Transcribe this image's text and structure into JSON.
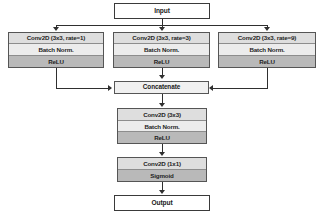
{
  "diagram": {
    "colors": {
      "background": "#ffffff",
      "line": "#2f2f2f",
      "border": "#555555",
      "header_fill": "#dedede",
      "norm_fill": "#ececec",
      "activation_fill": "#b9b9b9",
      "io_fill": "#ffffff",
      "concat_fill": "#f0f0f0"
    },
    "input": {
      "label": "Input"
    },
    "branches": [
      {
        "id": "branch-left",
        "rows": [
          {
            "label": "Conv2D (3x3, rate=1)",
            "style": "header"
          },
          {
            "label": "Batch Norm.",
            "style": "norm"
          },
          {
            "label": "ReLU",
            "style": "act"
          }
        ]
      },
      {
        "id": "branch-middle",
        "rows": [
          {
            "label": "Conv2D (3x3, rate=3)",
            "style": "header"
          },
          {
            "label": "Batch Norm.",
            "style": "norm"
          },
          {
            "label": "ReLU",
            "style": "act"
          }
        ]
      },
      {
        "id": "branch-right",
        "rows": [
          {
            "label": "Conv2D (3x3, rate=9)",
            "style": "header"
          },
          {
            "label": "Batch Norm.",
            "style": "norm"
          },
          {
            "label": "ReLU",
            "style": "act"
          }
        ]
      }
    ],
    "concatenate": {
      "label": "Concatenate"
    },
    "conv_block": {
      "rows": [
        {
          "label": "Conv2D (3x3)",
          "style": "header"
        },
        {
          "label": "Batch Norm.",
          "style": "norm"
        },
        {
          "label": "ReLU",
          "style": "act"
        }
      ]
    },
    "output_block": {
      "rows": [
        {
          "label": "Conv2D (1x1)",
          "style": "plain"
        },
        {
          "label": "Sigmoid",
          "style": "act"
        }
      ]
    },
    "output": {
      "label": "Output"
    }
  }
}
